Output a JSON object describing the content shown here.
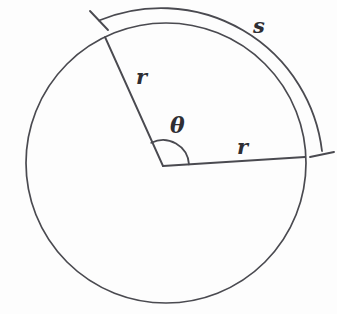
{
  "figure": {
    "name": "circle-arc-radius-angle-diagram",
    "background_color": "#fdfdfd",
    "stroke_color": "#4a4a50",
    "label_color": "#2e2e33",
    "width": 337,
    "height": 314
  },
  "geometry": {
    "circle": {
      "cx": 166,
      "cy": 163,
      "r": 140
    },
    "vertex": {
      "x": 163,
      "y": 166
    },
    "radius_upper_left_endpoint": {
      "x": 105,
      "y": 37
    },
    "radius_right_endpoint": {
      "x": 305,
      "y": 157
    },
    "angle_arc_radius": 26,
    "outer_arc": {
      "radius": 162,
      "start": {
        "x": 90,
        "y": 12
      },
      "end": {
        "x": 322,
        "y": 156
      }
    }
  },
  "labels": {
    "radius_upper": "r",
    "radius_right": "r",
    "central_angle": "θ",
    "arc_length": "s"
  }
}
